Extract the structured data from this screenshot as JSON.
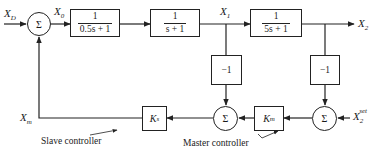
{
  "diagram": {
    "title": "",
    "signals": {
      "xd": {
        "base": "X",
        "sub": "D"
      },
      "x0": {
        "base": "X",
        "sub": "0"
      },
      "x1": {
        "base": "X",
        "sub": "1"
      },
      "x2": {
        "base": "X",
        "sub": "2"
      },
      "xm": {
        "base": "X",
        "sub": "m"
      },
      "x2set": {
        "base": "X",
        "sub": "2",
        "sup": "set"
      }
    },
    "blocks": [
      {
        "id": "g1",
        "num": "1",
        "den": "0.5s + 1"
      },
      {
        "id": "g2",
        "num": "1",
        "den": "s + 1"
      },
      {
        "id": "g3",
        "num": "1",
        "den": "5s + 1"
      }
    ],
    "gains": {
      "neg1_a": "−1",
      "neg1_b": "−1"
    },
    "controllers": {
      "ks": {
        "base": "K",
        "sub": "s"
      },
      "km": {
        "base": "K",
        "sub": "m"
      }
    },
    "summers": {
      "s1": "Σ",
      "s2": "Σ",
      "s3": "Σ"
    },
    "captions": {
      "slave": "Slave controller",
      "master": "Master controller"
    }
  }
}
